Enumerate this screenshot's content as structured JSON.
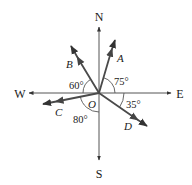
{
  "diagram": {
    "type": "compass-vector-diagram",
    "origin_label": "O",
    "directions": {
      "north": "N",
      "south": "S",
      "east": "E",
      "west": "W"
    },
    "vectors": [
      {
        "label": "A",
        "angle_label": "75°",
        "angle_deg": 75,
        "reference": "E",
        "quadrant": "NE"
      },
      {
        "label": "B",
        "angle_label": "60°",
        "angle_deg": 60,
        "reference": "W",
        "quadrant": "NW"
      },
      {
        "label": "C",
        "angle_label": "80°",
        "angle_deg": 80,
        "reference": "S",
        "quadrant": "SW"
      },
      {
        "label": "D",
        "angle_label": "35°",
        "angle_deg": 35,
        "reference": "E",
        "quadrant": "SE"
      }
    ],
    "colors": {
      "axis": "#555555",
      "vector": "#4a4a4a",
      "text": "#1a1a1a"
    }
  }
}
